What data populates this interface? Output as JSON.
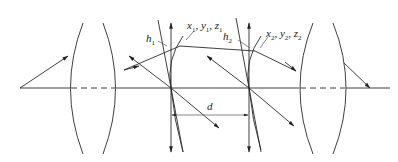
{
  "diagram": {
    "type": "optical-system",
    "labels": {
      "h1": {
        "base": "h",
        "sub": "1"
      },
      "h2": {
        "base": "h",
        "sub": "2"
      },
      "point1": {
        "x": "x",
        "xs": "1",
        "y": "y",
        "ys": "1",
        "z": "z",
        "zs": "1"
      },
      "point2": {
        "x": "x",
        "xs": "2",
        "y": "y",
        "ys": "2",
        "z": "z",
        "zs": "2"
      },
      "distance": "d"
    },
    "colors": {
      "line": "#2a2a2a",
      "background": "#ffffff"
    }
  }
}
